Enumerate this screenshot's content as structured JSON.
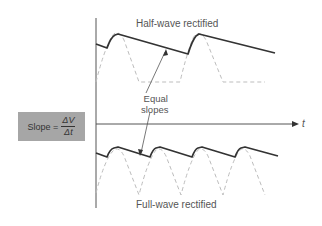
{
  "diagram": {
    "top_label": "Half-wave rectified",
    "bottom_label": "Full-wave rectified",
    "annotation": {
      "line1": "Equal",
      "line2": "slopes"
    },
    "axis_label": "t",
    "formula": {
      "lhs": "Slope =",
      "numerator": "ΔV",
      "denominator": "Δt"
    },
    "colors": {
      "solid_wave": "#333333",
      "dashed_wave": "#bdbdbd",
      "formula_box": "#a6a6a6",
      "axis": "#555555"
    }
  }
}
